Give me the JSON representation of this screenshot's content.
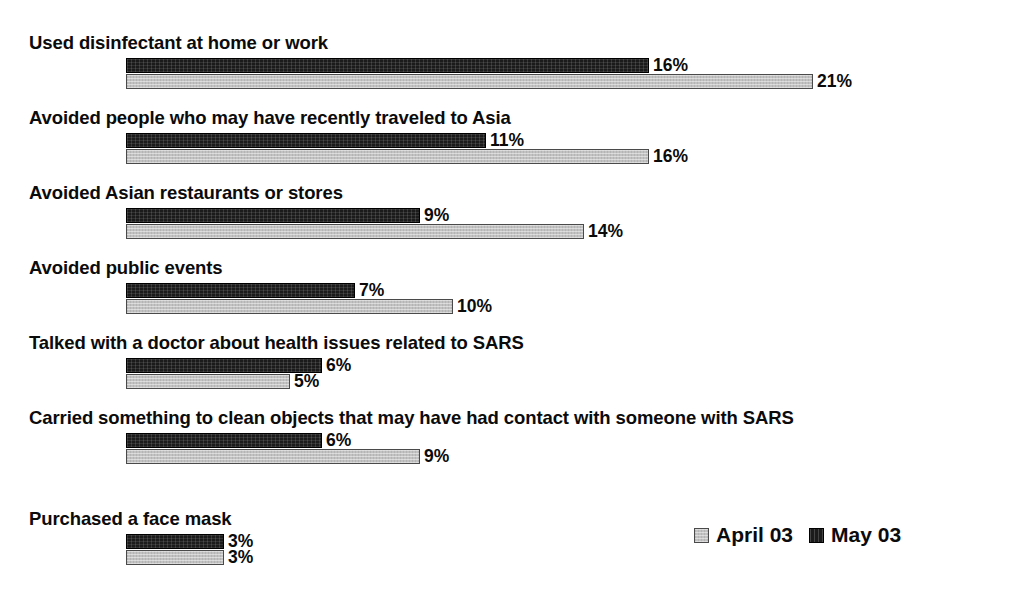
{
  "chart_data": {
    "type": "bar",
    "orientation": "horizontal",
    "title": "",
    "subtitle": "",
    "xlabel": "",
    "ylabel": "",
    "grid": false,
    "axis_visible": false,
    "xlim": [
      0,
      21
    ],
    "value_suffix": "%",
    "legend_position": "bottom-right",
    "categories": [
      "Used disinfectant at home or work",
      "Avoided people who may have recently traveled to Asia",
      "Avoided Asian restaurants or stores",
      "Avoided public events",
      "Talked with a doctor about health issues related to SARS",
      "Carried something to clean objects that may have had contact with someone with SARS",
      "Purchased a face mask"
    ],
    "series": [
      {
        "name": "May 03",
        "color": "#1b1b1b",
        "values": [
          16,
          11,
          9,
          7,
          6,
          6,
          3
        ],
        "labels": [
          "16%",
          "11%",
          "9%",
          "7%",
          "6%",
          "6%",
          "3%"
        ]
      },
      {
        "name": "April 03",
        "color": "#c2c2c2",
        "values": [
          21,
          16,
          14,
          10,
          5,
          9,
          3
        ],
        "labels": [
          "21%",
          "16%",
          "14%",
          "10%",
          "5%",
          "9%",
          "3%"
        ]
      }
    ]
  },
  "legend": {
    "entries": [
      {
        "label": "April 03",
        "swatch": "light-gray-square",
        "color": "#c2c2c2"
      },
      {
        "label": "May 03",
        "swatch": "dark-square",
        "color": "#1b1b1b"
      }
    ]
  },
  "groups": [
    {
      "label": "Used disinfectant at home or work",
      "dark": {
        "value": 16,
        "text": "16%"
      },
      "light": {
        "value": 21,
        "text": "21%"
      }
    },
    {
      "label": "Avoided people who may have recently traveled to Asia",
      "dark": {
        "value": 11,
        "text": "11%"
      },
      "light": {
        "value": 16,
        "text": "16%"
      }
    },
    {
      "label": "Avoided Asian restaurants or stores",
      "dark": {
        "value": 9,
        "text": "9%"
      },
      "light": {
        "value": 14,
        "text": "14%"
      }
    },
    {
      "label": "Avoided public events",
      "dark": {
        "value": 7,
        "text": "7%"
      },
      "light": {
        "value": 10,
        "text": "10%"
      }
    },
    {
      "label": "Talked with a doctor about health issues related to SARS",
      "dark": {
        "value": 6,
        "text": "6%"
      },
      "light": {
        "value": 5,
        "text": "5%"
      }
    },
    {
      "label": "Carried something to clean objects that may have had contact with someone with SARS",
      "dark": {
        "value": 6,
        "text": "6%"
      },
      "light": {
        "value": 9,
        "text": "9%"
      }
    },
    {
      "label": "Purchased a face mask",
      "dark": {
        "value": 3,
        "text": "3%"
      },
      "light": {
        "value": 3,
        "text": "3%"
      }
    }
  ],
  "layout": {
    "bar_origin_x": 126,
    "px_per_percent": 32.7,
    "group_tops": [
      32,
      107,
      182,
      257,
      332,
      407,
      508
    ]
  }
}
